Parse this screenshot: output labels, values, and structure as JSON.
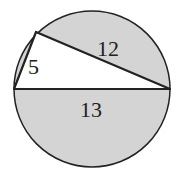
{
  "diagram": {
    "type": "circle-inscribed-right-triangle",
    "colors": {
      "shaded": "#d4d4d4",
      "triangle": "#ffffff",
      "stroke": "#222222"
    },
    "labels": {
      "short_leg": "5",
      "long_leg": "12",
      "hypotenuse": "13"
    }
  }
}
